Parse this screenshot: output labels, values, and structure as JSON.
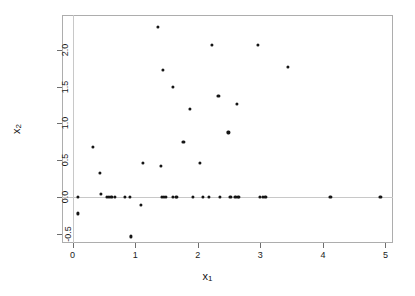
{
  "chart_data": {
    "type": "scatter",
    "title": "",
    "xlabel": "x1",
    "ylabel": "x2",
    "xlabel_display": "x",
    "xlabel_sub": "1",
    "ylabel_display": "x",
    "ylabel_sub": "2",
    "xlim": [
      -0.17,
      5.12
    ],
    "ylim": [
      -0.62,
      2.47
    ],
    "xticks": [
      0,
      1,
      2,
      3,
      4,
      5
    ],
    "xticklabels": [
      "0",
      "1",
      "2",
      "3",
      "4",
      "5"
    ],
    "yticks": [
      -0.5,
      0.0,
      0.5,
      1.0,
      1.5,
      2.0
    ],
    "yticklabels": [
      "-0.5",
      "0.0",
      "0.5",
      "1.0",
      "1.5",
      "2.0"
    ],
    "grid": false,
    "legend": null,
    "reference_lines": {
      "horizontal": [
        0.0
      ],
      "vertical": [
        0.0
      ],
      "color": "#c8c8c8"
    },
    "marker": {
      "shape": "circle",
      "color": "#151515",
      "size_px": 3.2
    },
    "frame_color": "#adadad",
    "background": "#ffffff",
    "n_points": 46,
    "points": [
      {
        "x": 0.08,
        "y": -0.22
      },
      {
        "x": 0.09,
        "y": 0.0
      },
      {
        "x": 0.32,
        "y": 0.68
      },
      {
        "x": 0.43,
        "y": 0.33
      },
      {
        "x": 0.45,
        "y": 0.05
      },
      {
        "x": 0.55,
        "y": 0.0
      },
      {
        "x": 0.62,
        "y": 0.0
      },
      {
        "x": 0.67,
        "y": 0.0
      },
      {
        "x": 0.84,
        "y": 0.0
      },
      {
        "x": 0.92,
        "y": 0.0
      },
      {
        "x": 0.93,
        "y": -0.53
      },
      {
        "x": 1.09,
        "y": -0.1
      },
      {
        "x": 1.12,
        "y": 0.47
      },
      {
        "x": 1.36,
        "y": 2.31
      },
      {
        "x": 1.41,
        "y": 0.42
      },
      {
        "x": 1.43,
        "y": 0.0
      },
      {
        "x": 1.44,
        "y": 1.73
      },
      {
        "x": 1.49,
        "y": 0.0
      },
      {
        "x": 1.6,
        "y": 1.49
      },
      {
        "x": 1.6,
        "y": 0.0
      },
      {
        "x": 1.65,
        "y": 0.0
      },
      {
        "x": 1.67,
        "y": 0.0
      },
      {
        "x": 1.77,
        "y": 0.75
      },
      {
        "x": 1.88,
        "y": 1.2
      },
      {
        "x": 1.92,
        "y": 0.0
      },
      {
        "x": 2.04,
        "y": 0.46
      },
      {
        "x": 2.08,
        "y": 0.0
      },
      {
        "x": 2.18,
        "y": 0.0
      },
      {
        "x": 2.22,
        "y": 2.06
      },
      {
        "x": 2.33,
        "y": 1.37
      },
      {
        "x": 2.35,
        "y": 0.0
      },
      {
        "x": 2.49,
        "y": 0.88
      },
      {
        "x": 2.52,
        "y": 0.0
      },
      {
        "x": 2.6,
        "y": 0.0
      },
      {
        "x": 2.63,
        "y": 1.26
      },
      {
        "x": 2.64,
        "y": 0.0
      },
      {
        "x": 2.66,
        "y": 0.0
      },
      {
        "x": 2.96,
        "y": 2.06
      },
      {
        "x": 2.99,
        "y": 0.0
      },
      {
        "x": 3.04,
        "y": 0.0
      },
      {
        "x": 3.08,
        "y": 0.0
      },
      {
        "x": 3.44,
        "y": 1.77
      },
      {
        "x": 4.12,
        "y": 0.0
      },
      {
        "x": 4.92,
        "y": 0.0
      },
      {
        "x": 1.46,
        "y": 0.0
      },
      {
        "x": 0.58,
        "y": 0.0
      }
    ]
  }
}
